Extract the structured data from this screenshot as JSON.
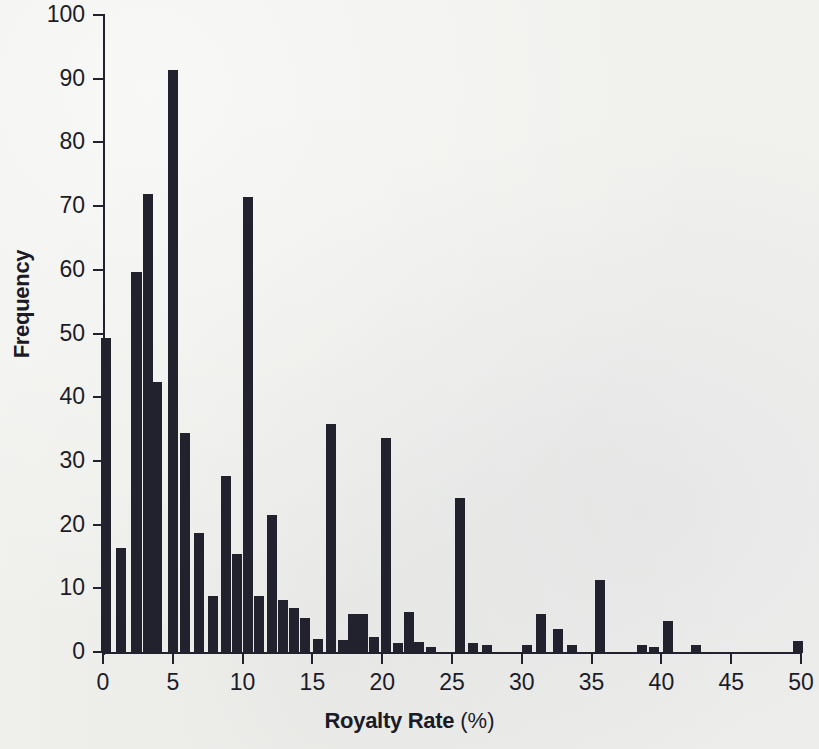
{
  "chart_data": {
    "type": "bar",
    "title": "",
    "subtitle": "",
    "xlabel": "Royalty Rate",
    "xlabel_unit": "(%)",
    "ylabel": "Frequency",
    "xlim": [
      0,
      50
    ],
    "ylim": [
      0,
      100
    ],
    "xticks": [
      0,
      5,
      10,
      15,
      20,
      25,
      30,
      35,
      40,
      45,
      50
    ],
    "yticks": [
      0,
      10,
      20,
      30,
      40,
      50,
      60,
      70,
      80,
      90,
      100
    ],
    "grid": false,
    "legend": null,
    "bar_color": "#22222e",
    "background_color": "#f1f1ee",
    "bin_width": 0.72,
    "x": [
      0.2,
      1.3,
      2.4,
      3.2,
      3.9,
      5.0,
      5.9,
      6.9,
      7.9,
      8.8,
      9.6,
      10.4,
      11.2,
      12.1,
      12.9,
      13.7,
      14.5,
      15.4,
      16.3,
      17.2,
      17.9,
      18.6,
      19.4,
      20.3,
      21.1,
      21.9,
      22.6,
      23.5,
      25.6,
      26.5,
      27.5,
      30.4,
      31.4,
      32.6,
      33.6,
      35.6,
      38.6,
      39.5,
      40.5,
      42.5,
      49.8
    ],
    "values": [
      49.5,
      16.5,
      59.8,
      72.0,
      42.6,
      91.5,
      34.6,
      18.8,
      9.0,
      27.8,
      15.6,
      71.6,
      9.0,
      21.7,
      8.4,
      7.0,
      5.5,
      2.2,
      35.9,
      2.1,
      6.2,
      6.1,
      2.5,
      33.7,
      1.5,
      6.5,
      1.7,
      1.0,
      24.4,
      1.5,
      1.3,
      1.2,
      6.2,
      3.8,
      1.2,
      11.5,
      1.2,
      1.0,
      5.0,
      1.2,
      1.9
    ]
  }
}
